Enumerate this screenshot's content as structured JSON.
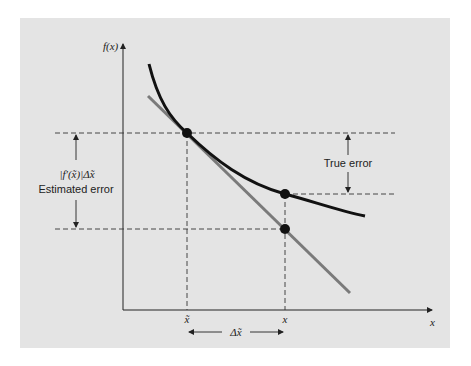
{
  "diagram": {
    "y_axis_label": "f(x)",
    "x_axis_label": "x",
    "x_tick_approx": "x̃",
    "x_tick_true": "x",
    "delta_label": "Δx̃",
    "estimated_error_formula": "|f′(x̃)|Δx̃",
    "estimated_error_label": "Estimated error",
    "true_error_label": "True error",
    "colors": {
      "panel": "#e4e4e4",
      "curve": "#111111",
      "tangent": "#7a7a7a",
      "guides": "#333333"
    }
  }
}
